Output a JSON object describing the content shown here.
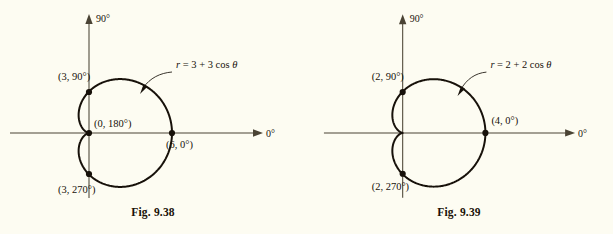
{
  "page": {
    "background_color": "#fdfcf2",
    "ink_color": "#17110a",
    "axis_color": "#4a4334"
  },
  "figures": [
    {
      "id": "fig-9-38",
      "caption": "Fig.  9.38",
      "equation": "r = 3 + 3 cos θ",
      "equation_parts": {
        "lhs": "r",
        "rhs": " = 3 + 3 cos ",
        "theta": "θ"
      },
      "axis_labels": {
        "vertical": "90°",
        "horizontal": "0°"
      },
      "points": [
        {
          "name": "point-3-90",
          "label": "(3, 90°)"
        },
        {
          "name": "point-0-180",
          "label": "(0, 180°)"
        },
        {
          "name": "point-6-0",
          "label": "(6, 0°)"
        },
        {
          "name": "point-3-270",
          "label": "(3, 270°)"
        }
      ]
    },
    {
      "id": "fig-9-39",
      "caption": "Fig.  9.39",
      "equation": "r = 2 + 2 cos θ",
      "equation_parts": {
        "lhs": "r",
        "rhs": " = 2 + 2 cos ",
        "theta": "θ"
      },
      "axis_labels": {
        "vertical": "90°",
        "horizontal": "0°"
      },
      "points": [
        {
          "name": "point-2-90",
          "label": "(2, 90°)"
        },
        {
          "name": "point-4-0",
          "label": "(4, 0°)"
        },
        {
          "name": "point-2-270",
          "label": "(2, 270°)"
        }
      ]
    }
  ],
  "chart_data": [
    {
      "type": "line",
      "subtype": "polar-cardioid",
      "title": "Fig.  9.38",
      "equation": "r = 3 + 3 cos θ",
      "a": 3,
      "b": 3,
      "formula": "r = a + b*cos(theta)",
      "xlabel": "0°",
      "ylabel": "90°",
      "grid": false,
      "legend": null,
      "annotations": [
        "r = 3 + 3 cos θ"
      ],
      "labeled_points": [
        {
          "label": "(3, 90°)",
          "r": 3,
          "theta_deg": 90
        },
        {
          "label": "(0, 180°)",
          "r": 0,
          "theta_deg": 180
        },
        {
          "label": "(6, 0°)",
          "r": 6,
          "theta_deg": 0
        },
        {
          "label": "(3, 270°)",
          "r": 3,
          "theta_deg": 270
        }
      ]
    },
    {
      "type": "line",
      "subtype": "polar-cardioid",
      "title": "Fig.  9.39",
      "equation": "r = 2 + 2 cos θ",
      "a": 2,
      "b": 2,
      "formula": "r = a + b*cos(theta)",
      "xlabel": "0°",
      "ylabel": "90°",
      "grid": false,
      "legend": null,
      "annotations": [
        "r = 2 + 2 cos θ"
      ],
      "labeled_points": [
        {
          "label": "(2, 90°)",
          "r": 2,
          "theta_deg": 90
        },
        {
          "label": "(4, 0°)",
          "r": 4,
          "theta_deg": 0
        },
        {
          "label": "(2, 270°)",
          "r": 2,
          "theta_deg": 270
        }
      ]
    }
  ]
}
